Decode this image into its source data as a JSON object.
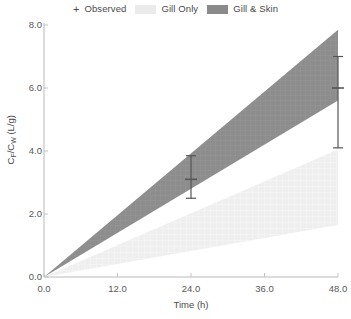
{
  "legend": {
    "entries": [
      {
        "name": "observed",
        "marker": "plus-marker",
        "symbol": "+",
        "label": "Observed"
      },
      {
        "name": "gill-only",
        "marker": "band-swatch",
        "label": "Gill Only",
        "color": "#ebebeb"
      },
      {
        "name": "gill-and-skin",
        "marker": "band-swatch",
        "label": "Gill & Skin",
        "color": "#8a8a8a"
      }
    ]
  },
  "chart_data": {
    "type": "area",
    "title": "",
    "xlabel": "Time (h)",
    "ylabel": "CF/CW (L/g)",
    "ylabel_parts": {
      "pre": "C",
      "sub1": "F",
      "mid": "/C",
      "sub2": "W",
      "post": " (L/g)"
    },
    "xlim": [
      0.0,
      48.0
    ],
    "ylim": [
      0.0,
      8.0
    ],
    "xticks": [
      "0.0",
      "12.0",
      "24.0",
      "36.0",
      "48.0"
    ],
    "xtick_values": [
      0.0,
      12.0,
      24.0,
      36.0,
      48.0
    ],
    "yticks": [
      "0.0",
      "2.0",
      "4.0",
      "6.0",
      "8.0"
    ],
    "ytick_values": [
      0.0,
      2.0,
      4.0,
      6.0,
      8.0
    ],
    "grid": false,
    "legend_position": "top-center",
    "bands": [
      {
        "name": "Gill & Skin",
        "color": "#8a8a8a",
        "x": [
          0.0,
          48.0
        ],
        "upper": [
          0.0,
          7.85
        ],
        "lower": [
          0.0,
          5.6
        ]
      },
      {
        "name": "Gill Only",
        "color": "#ebebeb",
        "x": [
          0.0,
          48.0
        ],
        "upper": [
          0.0,
          4.05
        ],
        "lower": [
          0.0,
          1.65
        ]
      }
    ],
    "observed": {
      "name": "Observed",
      "color": "#555555",
      "points": [
        {
          "x": 24.0,
          "y": 3.1,
          "err_upper": 3.85,
          "err_lower": 2.5
        },
        {
          "x": 48.0,
          "y": 6.0,
          "err_upper": 7.0,
          "err_lower": 4.1
        }
      ]
    }
  }
}
